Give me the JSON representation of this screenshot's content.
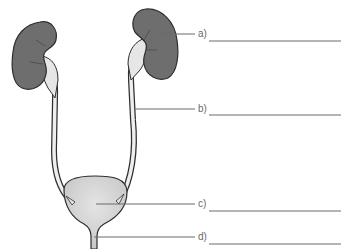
{
  "diagram": {
    "colors": {
      "kidney_fill": "#6e6e6e",
      "outline": "#2e2e2e",
      "tube_fill": "#e6e6e6",
      "bladder_fill": "#d8d8d8",
      "pointer_line": "#6a6a6a"
    },
    "labels": [
      {
        "key": "a",
        "text": "a)",
        "answer": ""
      },
      {
        "key": "b",
        "text": "b)",
        "answer": ""
      },
      {
        "key": "c",
        "text": "c)",
        "answer": ""
      },
      {
        "key": "d",
        "text": "d)",
        "answer": ""
      }
    ]
  }
}
